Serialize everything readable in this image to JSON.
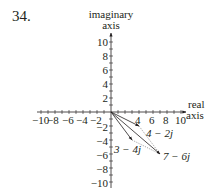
{
  "problem_number": "34.",
  "diagram": {
    "type": "complex-plane vector addition",
    "y_axis_label": [
      "imaginary",
      "axis"
    ],
    "x_axis_label": [
      "real",
      "axis"
    ],
    "x_ticks": [
      "−10",
      "−8",
      "−6",
      "−4",
      "−2",
      "4",
      "6",
      "8",
      "10"
    ],
    "y_ticks": [
      "10",
      "8",
      "6",
      "4",
      "2",
      "−2",
      "−4",
      "−6",
      "−8",
      "−10"
    ],
    "vectors": [
      {
        "label": "4 − 2j",
        "re": 4,
        "im": -2
      },
      {
        "label": "3 − 4j",
        "re": 3,
        "im": -4
      },
      {
        "label": "7 − 6j",
        "re": 7,
        "im": -6
      }
    ],
    "colors": {
      "ink": "#231f20",
      "dotted": "#808080"
    }
  }
}
